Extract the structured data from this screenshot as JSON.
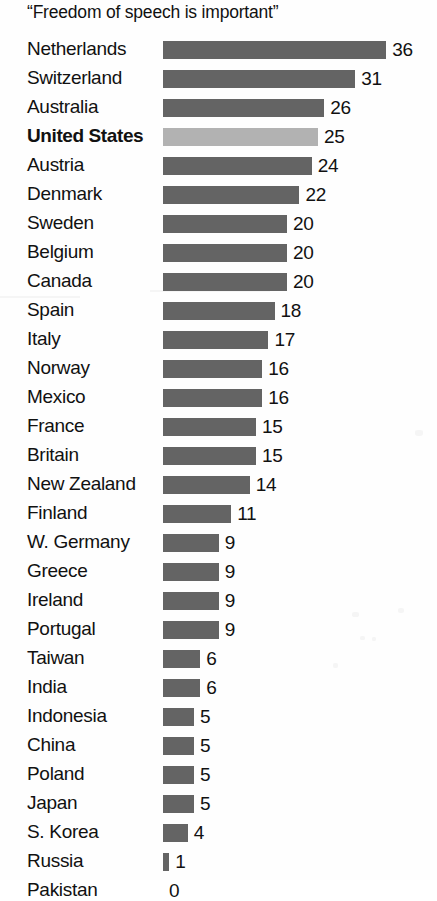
{
  "chart_data": {
    "type": "bar",
    "orientation": "horizontal",
    "title": "“Freedom of speech is important”",
    "xlabel": "",
    "ylabel": "",
    "xlim": [
      0,
      36
    ],
    "grid": false,
    "legend": "none",
    "value_label_position": "outside-end",
    "sort": "descending",
    "highlight_category": "United States",
    "colors": {
      "bar": "#646464",
      "bar_highlight": "#b2b2b2",
      "text": "#111111",
      "background": "#ffffff"
    },
    "categories": [
      "Netherlands",
      "Switzerland",
      "Australia",
      "United States",
      "Austria",
      "Denmark",
      "Sweden",
      "Belgium",
      "Canada",
      "Spain",
      "Italy",
      "Norway",
      "Mexico",
      "France",
      "Britain",
      "New Zealand",
      "Finland",
      "W. Germany",
      "Greece",
      "Ireland",
      "Portugal",
      "Taiwan",
      "India",
      "Indonesia",
      "China",
      "Poland",
      "Japan",
      "S. Korea",
      "Russia",
      "Pakistan"
    ],
    "values": [
      36,
      31,
      26,
      25,
      24,
      22,
      20,
      20,
      20,
      18,
      17,
      16,
      16,
      15,
      15,
      14,
      11,
      9,
      9,
      9,
      9,
      6,
      6,
      5,
      5,
      5,
      5,
      4,
      1,
      0
    ],
    "rows": [
      {
        "label": "Netherlands",
        "value": 36,
        "value_text": "36",
        "highlighted": false
      },
      {
        "label": "Switzerland",
        "value": 31,
        "value_text": "31",
        "highlighted": false
      },
      {
        "label": "Australia",
        "value": 26,
        "value_text": "26",
        "highlighted": false
      },
      {
        "label": "United States",
        "value": 25,
        "value_text": "25",
        "highlighted": true
      },
      {
        "label": "Austria",
        "value": 24,
        "value_text": "24",
        "highlighted": false
      },
      {
        "label": "Denmark",
        "value": 22,
        "value_text": "22",
        "highlighted": false
      },
      {
        "label": "Sweden",
        "value": 20,
        "value_text": "20",
        "highlighted": false
      },
      {
        "label": "Belgium",
        "value": 20,
        "value_text": "20",
        "highlighted": false
      },
      {
        "label": "Canada",
        "value": 20,
        "value_text": "20",
        "highlighted": false
      },
      {
        "label": "Spain",
        "value": 18,
        "value_text": "18",
        "highlighted": false
      },
      {
        "label": "Italy",
        "value": 17,
        "value_text": "17",
        "highlighted": false
      },
      {
        "label": "Norway",
        "value": 16,
        "value_text": "16",
        "highlighted": false
      },
      {
        "label": "Mexico",
        "value": 16,
        "value_text": "16",
        "highlighted": false
      },
      {
        "label": "France",
        "value": 15,
        "value_text": "15",
        "highlighted": false
      },
      {
        "label": "Britain",
        "value": 15,
        "value_text": "15",
        "highlighted": false
      },
      {
        "label": "New Zealand",
        "value": 14,
        "value_text": "14",
        "highlighted": false
      },
      {
        "label": "Finland",
        "value": 11,
        "value_text": "11",
        "highlighted": false
      },
      {
        "label": "W. Germany",
        "value": 9,
        "value_text": "9",
        "highlighted": false
      },
      {
        "label": "Greece",
        "value": 9,
        "value_text": "9",
        "highlighted": false
      },
      {
        "label": "Ireland",
        "value": 9,
        "value_text": "9",
        "highlighted": false
      },
      {
        "label": "Portugal",
        "value": 9,
        "value_text": "9",
        "highlighted": false
      },
      {
        "label": "Taiwan",
        "value": 6,
        "value_text": "6",
        "highlighted": false
      },
      {
        "label": "India",
        "value": 6,
        "value_text": "6",
        "highlighted": false
      },
      {
        "label": "Indonesia",
        "value": 5,
        "value_text": "5",
        "highlighted": false
      },
      {
        "label": "China",
        "value": 5,
        "value_text": "5",
        "highlighted": false
      },
      {
        "label": "Poland",
        "value": 5,
        "value_text": "5",
        "highlighted": false
      },
      {
        "label": "Japan",
        "value": 5,
        "value_text": "5",
        "highlighted": false
      },
      {
        "label": "S. Korea",
        "value": 4,
        "value_text": "4",
        "highlighted": false
      },
      {
        "label": "Russia",
        "value": 1,
        "value_text": "1",
        "highlighted": false
      },
      {
        "label": "Pakistan",
        "value": 0,
        "value_text": "0",
        "highlighted": false
      }
    ]
  },
  "layout": {
    "px_per_unit": 6.2,
    "bar_origin_x": 163,
    "row_pitch": 29,
    "bar_height": 18,
    "value_gap": 6
  }
}
